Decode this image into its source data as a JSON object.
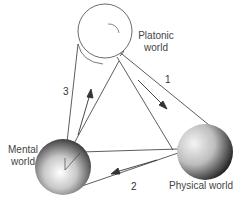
{
  "diagram": {
    "type": "three-worlds",
    "nodes": [
      {
        "id": "platonic",
        "label_line1": "Platonic",
        "label_line2": "world"
      },
      {
        "id": "mental",
        "label_line1": "Mental",
        "label_line2": "world"
      },
      {
        "id": "physical",
        "label_line1": "Physical world"
      }
    ],
    "edges": [
      {
        "number": "1",
        "from": "platonic",
        "to": "physical"
      },
      {
        "number": "2",
        "from": "physical",
        "to": "mental"
      },
      {
        "number": "3",
        "from": "mental",
        "to": "platonic"
      }
    ]
  }
}
